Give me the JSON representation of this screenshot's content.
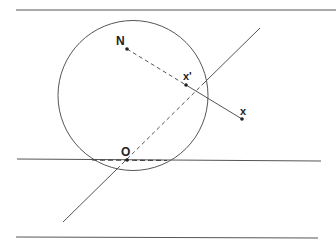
{
  "diagram": {
    "type": "stereographic-projection",
    "colors": {
      "stroke": "#555555",
      "point": "#222222",
      "background": "#ffffff"
    },
    "horizontal_lines": [
      {
        "name": "top-plane-line",
        "x1": 16,
        "y1": 10,
        "x2": 336,
        "y2": 10
      },
      {
        "name": "middle-plane-line",
        "x1": 17,
        "y1": 159,
        "x2": 321,
        "y2": 161
      },
      {
        "name": "bottom-plane-line",
        "x1": 16,
        "y1": 237,
        "x2": 318,
        "y2": 238
      }
    ],
    "circle": {
      "cx": 133,
      "cy": 95.5,
      "r": 75
    },
    "diagonal_line": {
      "x1": 63,
      "y1": 222,
      "x2": 260,
      "y2": 28
    },
    "points": {
      "N": {
        "label": "N",
        "x": 127,
        "y": 49
      },
      "x_prime": {
        "label": "x'",
        "x": 186,
        "y": 85
      },
      "x": {
        "label": "x",
        "x": 242,
        "y": 119
      },
      "O": {
        "label": "O",
        "x": 127,
        "y": 160
      }
    }
  }
}
